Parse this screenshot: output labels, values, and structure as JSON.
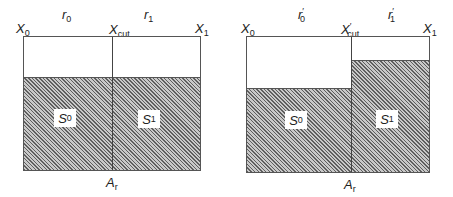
{
  "diagrams": [
    {
      "id": "left",
      "labels": {
        "x0": "X",
        "x0_sub": "0",
        "xcut": "X",
        "xcut_sub": "cut",
        "xcut_prime": "",
        "x1": "X",
        "x1_sub": "1",
        "r0": "r",
        "r0_sub": "0",
        "r0_prime": "",
        "r1": "r",
        "r1_sub": "1",
        "r1_prime": "",
        "s0": "S",
        "s0_sub": "0",
        "s1": "S",
        "s1_sub": "1",
        "ar": "A",
        "ar_sub": "r"
      },
      "fill_fraction": {
        "left": 0.67,
        "right": 0.67
      }
    },
    {
      "id": "right",
      "labels": {
        "x0": "X",
        "x0_sub": "0",
        "xcut": "X",
        "xcut_sub": "cut",
        "xcut_prime": "′",
        "x1": "X",
        "x1_sub": "1",
        "r0": "r",
        "r0_sub": "0",
        "r0_prime": "′",
        "r1": "r",
        "r1_sub": "1",
        "r1_prime": "′",
        "s0": "S",
        "s0_sub": "0",
        "s1": "S",
        "s1_sub": "1",
        "ar": "A",
        "ar_sub": "r"
      },
      "fill_fraction": {
        "left": 0.6,
        "right": 0.82
      }
    }
  ]
}
